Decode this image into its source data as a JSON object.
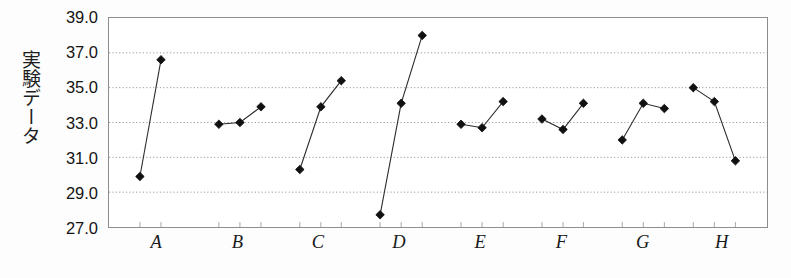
{
  "chart_data": {
    "type": "scatter",
    "title": "",
    "xlabel": "",
    "ylabel": "実験データ",
    "ylim": [
      27.0,
      39.0
    ],
    "ytick_step": 2.0,
    "ytick_labels": [
      "39.0",
      "37.0",
      "35.0",
      "33.0",
      "31.0",
      "29.0",
      "27.0"
    ],
    "ytick_values": [
      39.0,
      37.0,
      35.0,
      33.0,
      31.0,
      29.0,
      27.0
    ],
    "categories": [
      "A",
      "B",
      "C",
      "D",
      "E",
      "F",
      "G",
      "H"
    ],
    "grid": "horizontal-dotted",
    "legend": "none",
    "marker": "filled-diamond",
    "marker_color": "#111111",
    "line_color": "#2b2b2b",
    "groups": [
      {
        "label": "A",
        "x_positions": [
          0.047,
          0.079
        ],
        "values": [
          29.9,
          36.6
        ]
      },
      {
        "label": "B",
        "x_positions": [
          0.167,
          0.199,
          0.231
        ],
        "values": [
          32.9,
          33.0,
          33.9
        ]
      },
      {
        "label": "C",
        "x_positions": [
          0.29,
          0.322,
          0.353
        ],
        "values": [
          30.3,
          33.9,
          35.4
        ]
      },
      {
        "label": "D",
        "x_positions": [
          0.412,
          0.444,
          0.476
        ],
        "values": [
          27.7,
          34.1,
          38.0
        ]
      },
      {
        "label": "E",
        "x_positions": [
          0.535,
          0.567,
          0.599
        ],
        "values": [
          32.9,
          32.7,
          34.2
        ]
      },
      {
        "label": "F",
        "x_positions": [
          0.658,
          0.69,
          0.721
        ],
        "values": [
          33.2,
          32.6,
          34.1
        ]
      },
      {
        "label": "G",
        "x_positions": [
          0.78,
          0.812,
          0.844
        ],
        "values": [
          32.0,
          34.1,
          33.8
        ]
      },
      {
        "label": "H",
        "x_positions": [
          0.888,
          0.92,
          0.952
        ],
        "values": [
          35.0,
          34.2,
          30.8
        ]
      }
    ],
    "category_label_x": [
      0.073,
      0.196,
      0.318,
      0.441,
      0.564,
      0.687,
      0.81,
      0.93
    ]
  }
}
